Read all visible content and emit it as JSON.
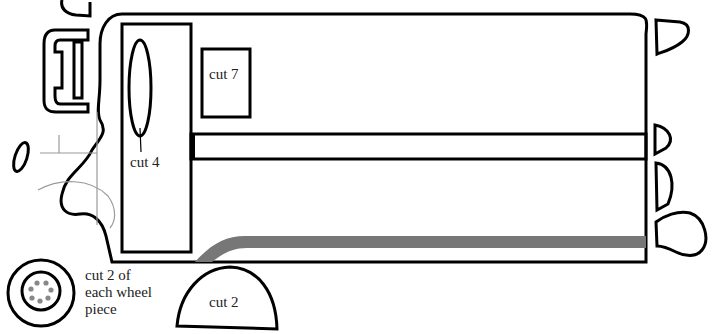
{
  "colors": {
    "outline": "#000000",
    "stripe": "#777777",
    "detail_line": "#999999",
    "lug_dots": "#888888",
    "background": "#ffffff"
  },
  "labels": {
    "cut_4": "cut 4",
    "cut_7": "cut 7",
    "cut_2": "cut 2",
    "wheel_note_line1": "cut 2 of",
    "wheel_note_line2": "each wheel",
    "wheel_note_line3": "piece"
  },
  "pieces": [
    {
      "name": "bus-body",
      "label": ""
    },
    {
      "name": "window-panel",
      "label": ""
    },
    {
      "name": "oval-window",
      "label": "cut 4"
    },
    {
      "name": "square-window",
      "label": "cut 7"
    },
    {
      "name": "side-bar",
      "label": ""
    },
    {
      "name": "grille",
      "label": ""
    },
    {
      "name": "side-mirror",
      "label": ""
    },
    {
      "name": "rear-lights",
      "label": ""
    },
    {
      "name": "wheel",
      "label": "cut 2 of each wheel piece"
    },
    {
      "name": "wheel-arch",
      "label": "cut 2"
    }
  ]
}
